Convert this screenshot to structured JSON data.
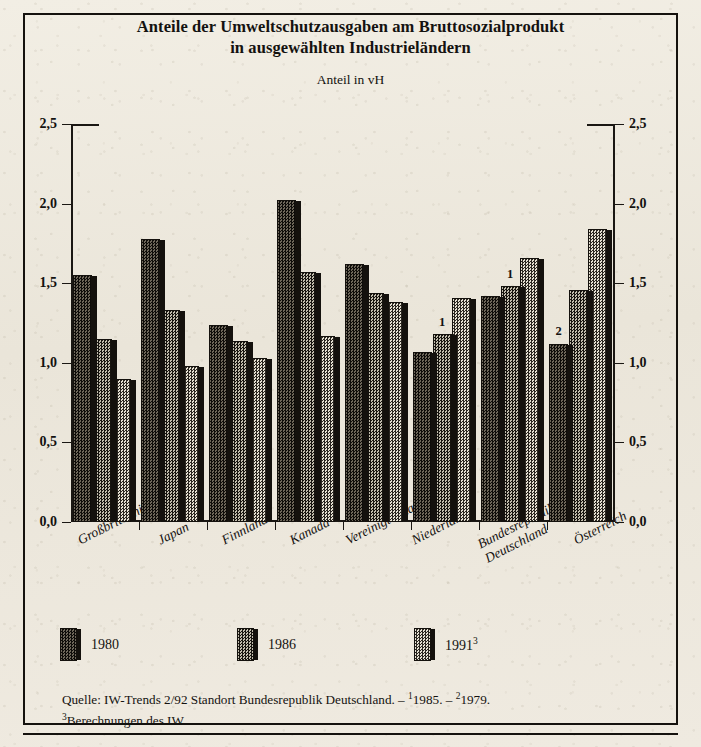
{
  "figure": {
    "title_line1": "Anteile der Umweltschutzausgaben am Bruttosozialprodukt",
    "title_line2": "in ausgewählten Industrieländern",
    "subtitle": "Anteil in vH"
  },
  "legend": {
    "position": "bottom-left",
    "items": [
      {
        "label": "1980",
        "sup": "",
        "swatch": "dark-checker-swatch"
      },
      {
        "label": "1986",
        "sup": "",
        "swatch": "medium-checker-swatch"
      },
      {
        "label": "1991",
        "sup": "3",
        "swatch": "light-checker-swatch"
      }
    ]
  },
  "source": {
    "line1_main": "Quelle: IW-Trends 2/92 Standort Bundesrepublik Deutschland. – ",
    "note1_sup": "1",
    "note1_text": "1985. – ",
    "note2_sup": "2",
    "note2_text": "1979.",
    "note3_sup": "3",
    "note3_text": "Berechnungen des IW."
  },
  "chart_data": {
    "type": "bar",
    "title": "Anteile der Umweltschutzausgaben am Bruttosozialprodukt in ausgewählten Industrieländern",
    "subtitle": "Anteil in vH",
    "xlabel": "",
    "ylabel": "Anteil in vH",
    "ylim": [
      0.0,
      2.5
    ],
    "ytick_labels": [
      "0,0",
      "0,5",
      "1,0",
      "1,5",
      "2,0",
      "2,5"
    ],
    "ytick_values": [
      0.0,
      0.5,
      1.0,
      1.5,
      2.0,
      2.5
    ],
    "grid": false,
    "dual_axis": true,
    "categories": [
      "Großbritannien",
      "Japan",
      "Finnland",
      "Kanada",
      "Vereinigte Staaten",
      "Niederlande",
      "Bundesrepublik Deutschland",
      "Österreich"
    ],
    "category_lines": [
      [
        "Großbritannien"
      ],
      [
        "Japan"
      ],
      [
        "Finnland"
      ],
      [
        "Kanada"
      ],
      [
        "Vereinigte Staaten"
      ],
      [
        "Niederlande"
      ],
      [
        "Bundesrepublik",
        "Deutschland"
      ],
      [
        "Österreich"
      ]
    ],
    "series": [
      {
        "name": "1980",
        "values": [
          1.55,
          1.78,
          1.24,
          2.02,
          1.62,
          1.07,
          1.42,
          1.12
        ]
      },
      {
        "name": "1986",
        "values": [
          1.15,
          1.33,
          1.14,
          1.57,
          1.44,
          1.18,
          1.48,
          1.46
        ]
      },
      {
        "name": "1991",
        "values": [
          0.9,
          0.98,
          1.03,
          1.17,
          1.38,
          1.41,
          1.66,
          1.84
        ]
      }
    ],
    "bar_annotations": [
      {
        "category": "Niederlande",
        "series": "1986",
        "text": "1"
      },
      {
        "category": "Bundesrepublik Deutschland",
        "series": "1986",
        "text": "1"
      },
      {
        "category": "Österreich",
        "series": "1980",
        "text": "2"
      }
    ]
  }
}
